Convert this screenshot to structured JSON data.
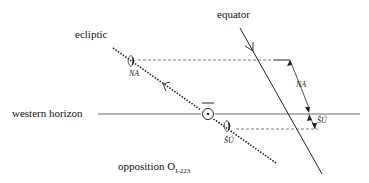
{
  "labels": {
    "equator": "equator",
    "ecliptic": "ecliptic",
    "western_horizon": "western horizon",
    "opposition_main": "opposition O",
    "opposition_sub": "I-223",
    "na_moon": "NA",
    "na_interval": "NA",
    "su_moon": "ŠÚ",
    "su_interval": "ŠÚ"
  },
  "symbols": {
    "sun": "sun-symbol",
    "moon_crescent": "moon-crescent"
  },
  "colors": {
    "line": "#222222",
    "background": "#ffffff"
  }
}
